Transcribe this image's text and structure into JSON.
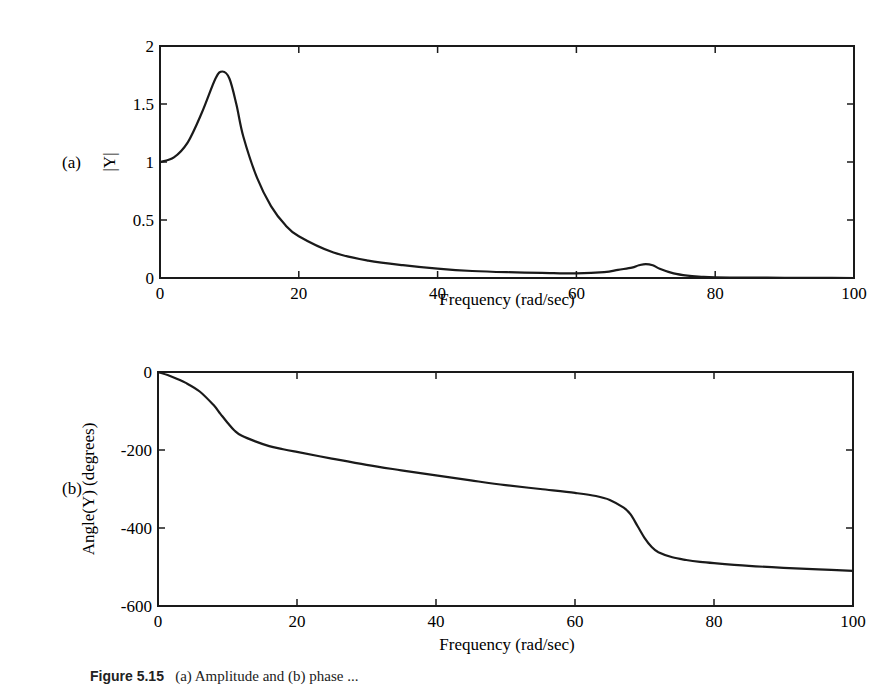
{
  "figure": {
    "caption_label": "Figure 5.15",
    "caption_text": "(a) Amplitude and (b) phase ..."
  },
  "chart_data": [
    {
      "panel": "(a)",
      "type": "line",
      "title": "",
      "xlabel": "Frequency (rad/sec)",
      "ylabel": "|Y|",
      "xlim": [
        0,
        100
      ],
      "ylim": [
        0,
        2
      ],
      "xticks": [
        0,
        20,
        40,
        60,
        80,
        100
      ],
      "yticks": [
        0,
        0.5,
        1,
        1.5,
        2
      ],
      "xtick_labels": [
        "0",
        "20",
        "40",
        "60",
        "80",
        "100"
      ],
      "ytick_labels": [
        "0",
        "0.5",
        "1",
        "1.5",
        "2"
      ],
      "grid": false,
      "legend": null,
      "series": [
        {
          "name": "|Y|",
          "x": [
            0,
            2,
            4,
            6,
            8,
            9,
            10,
            11,
            12,
            14,
            16,
            18,
            20,
            25,
            30,
            35,
            40,
            45,
            50,
            55,
            60,
            64,
            66,
            68,
            69,
            70,
            71,
            72,
            74,
            76,
            78,
            80,
            85,
            90,
            95,
            100
          ],
          "values": [
            1.0,
            1.04,
            1.17,
            1.42,
            1.72,
            1.78,
            1.72,
            1.5,
            1.22,
            0.86,
            0.62,
            0.46,
            0.36,
            0.22,
            0.15,
            0.11,
            0.08,
            0.06,
            0.05,
            0.045,
            0.04,
            0.05,
            0.07,
            0.09,
            0.11,
            0.12,
            0.11,
            0.08,
            0.04,
            0.02,
            0.01,
            0.005,
            0.003,
            0.002,
            0.001,
            0.0
          ]
        }
      ]
    },
    {
      "panel": "(b)",
      "type": "line",
      "title": "",
      "xlabel": "Frequency (rad/sec)",
      "ylabel": "Angle(Y) (degrees)",
      "xlim": [
        0,
        100
      ],
      "ylim": [
        -600,
        0
      ],
      "xticks": [
        0,
        20,
        40,
        60,
        80,
        100
      ],
      "yticks": [
        -600,
        -400,
        -200,
        0
      ],
      "xtick_labels": [
        "0",
        "20",
        "40",
        "60",
        "80",
        "100"
      ],
      "ytick_labels": [
        "-600",
        "-400",
        "-200",
        "0"
      ],
      "grid": false,
      "legend": null,
      "series": [
        {
          "name": "Angle(Y)",
          "x": [
            0,
            2,
            4,
            6,
            8,
            9,
            10,
            11,
            12,
            14,
            16,
            18,
            20,
            25,
            30,
            35,
            40,
            45,
            50,
            55,
            60,
            63,
            65,
            67,
            68,
            69,
            70,
            71,
            72,
            74,
            76,
            78,
            80,
            85,
            90,
            95,
            100
          ],
          "values": [
            0,
            -12,
            -28,
            -50,
            -85,
            -108,
            -130,
            -150,
            -163,
            -178,
            -190,
            -198,
            -205,
            -222,
            -238,
            -252,
            -265,
            -278,
            -290,
            -300,
            -310,
            -318,
            -328,
            -348,
            -365,
            -395,
            -425,
            -448,
            -462,
            -475,
            -482,
            -487,
            -490,
            -497,
            -502,
            -506,
            -510
          ]
        }
      ]
    }
  ],
  "labels": {
    "panel_a": "(a)",
    "panel_b": "(b)",
    "a_ylabel": "|Y|",
    "b_ylabel": "Angle(Y) (degrees)",
    "xlabel": "Frequency (rad/sec)"
  },
  "style": {
    "line_color": "#1a1a1a",
    "axis_color": "#1a1a1a",
    "background": "#ffffff"
  }
}
